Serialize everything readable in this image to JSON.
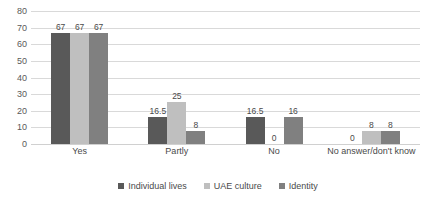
{
  "chart_data": {
    "type": "bar",
    "title": "",
    "subtitle": "",
    "xlabel": "",
    "ylabel": "",
    "ylim": [
      0,
      80
    ],
    "ytick_step": 10,
    "yticks": [
      80,
      70,
      60,
      50,
      40,
      30,
      20,
      10,
      0
    ],
    "grid": true,
    "legend_position": "bottom",
    "categories": [
      "Yes",
      "Partly",
      "No",
      "No answer/don't know"
    ],
    "series": [
      {
        "name": "Individual lives",
        "color": "#595959",
        "values": [
          67,
          16.5,
          16.5,
          0
        ],
        "labels": [
          "67",
          "16.5",
          "16.5",
          "0"
        ]
      },
      {
        "name": "UAE culture",
        "color": "#bfbfbf",
        "values": [
          67,
          25,
          0,
          8
        ],
        "labels": [
          "67",
          "25",
          "0",
          "8"
        ]
      },
      {
        "name": "Identity",
        "color": "#808080",
        "values": [
          67,
          8,
          16,
          8
        ],
        "labels": [
          "67",
          "8",
          "16",
          "8"
        ]
      }
    ]
  },
  "legend": {
    "items": [
      {
        "label": "Individual lives",
        "color": "#595959"
      },
      {
        "label": "UAE culture",
        "color": "#bfbfbf"
      },
      {
        "label": "Identity",
        "color": "#808080"
      }
    ]
  },
  "axes": {
    "y_tick_labels": [
      "80",
      "70",
      "60",
      "50",
      "40",
      "30",
      "20",
      "10",
      "0"
    ],
    "x_tick_labels": [
      "Yes",
      "Partly",
      "No",
      "No answer/don't know"
    ]
  },
  "colors": {
    "gridline": "#d9d9d9",
    "text": "#4a4a4a",
    "background": "#ffffff"
  }
}
